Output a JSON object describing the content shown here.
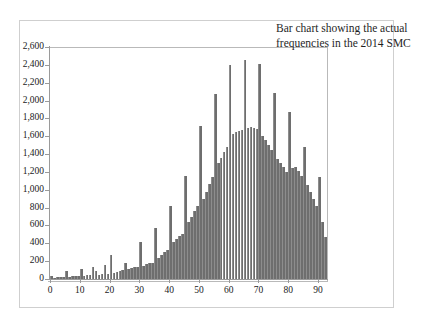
{
  "caption": {
    "text": "Bar chart showing the actual frequencies in the 2014 SMC"
  },
  "chart_data": {
    "type": "bar",
    "title": "Bar chart showing the actual frequencies in the 2014 SMC",
    "xlabel": "",
    "ylabel": "",
    "xlim": [
      0,
      93
    ],
    "ylim": [
      0,
      2600
    ],
    "grid": false,
    "legend": null,
    "bar_color": "#6e6e6e",
    "axis_color": "#9a9a9a",
    "frame_color": "#b9b9b9",
    "outer_frame_color": "#cfcfcf",
    "y_ticks": [
      0,
      200,
      400,
      600,
      800,
      1000,
      1200,
      1400,
      1600,
      1800,
      2000,
      2200,
      2400,
      2600
    ],
    "y_tick_labels": [
      "0",
      "200",
      "400",
      "600",
      "800",
      "1,000",
      "1,200",
      "1,400",
      "1,600",
      "1,800",
      "2,000",
      "2,200",
      "2,400",
      "2,600"
    ],
    "x_ticks": [
      0,
      10,
      20,
      30,
      40,
      50,
      60,
      70,
      80,
      90
    ],
    "x_tick_labels": [
      "0",
      "10",
      "20",
      "30",
      "40",
      "50",
      "60",
      "70",
      "80",
      "90"
    ],
    "categories": [
      0,
      1,
      2,
      3,
      4,
      5,
      6,
      7,
      8,
      9,
      10,
      11,
      12,
      13,
      14,
      15,
      16,
      17,
      18,
      19,
      20,
      21,
      22,
      23,
      24,
      25,
      26,
      27,
      28,
      29,
      30,
      31,
      32,
      33,
      34,
      35,
      36,
      37,
      38,
      39,
      40,
      41,
      42,
      43,
      44,
      45,
      46,
      47,
      48,
      49,
      50,
      51,
      52,
      53,
      54,
      55,
      56,
      57,
      58,
      59,
      60,
      61,
      62,
      63,
      64,
      65,
      66,
      67,
      68,
      69,
      70,
      71,
      72,
      73,
      74,
      75,
      76,
      77,
      78,
      79,
      80,
      81,
      82,
      83,
      84,
      85,
      86,
      87,
      88,
      89,
      90,
      91,
      92
    ],
    "values": [
      35,
      15,
      20,
      20,
      25,
      95,
      25,
      30,
      30,
      35,
      110,
      35,
      40,
      45,
      130,
      95,
      45,
      55,
      155,
      60,
      265,
      70,
      80,
      90,
      105,
      175,
      115,
      125,
      130,
      140,
      415,
      150,
      165,
      175,
      180,
      575,
      235,
      265,
      300,
      330,
      820,
      420,
      450,
      480,
      510,
      1160,
      640,
      700,
      760,
      820,
      1720,
      900,
      980,
      1060,
      1140,
      2070,
      1300,
      1360,
      1420,
      1480,
      2400,
      1620,
      1650,
      1660,
      1670,
      2460,
      1690,
      1700,
      1690,
      1680,
      2410,
      1600,
      1560,
      1500,
      1450,
      2090,
      1350,
      1300,
      1250,
      1200,
      1870,
      1240,
      1260,
      1210,
      1160,
      1480,
      1050,
      980,
      900,
      820,
      1140,
      640,
      470
    ]
  }
}
